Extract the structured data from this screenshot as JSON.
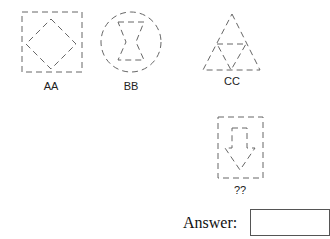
{
  "puzzle": {
    "figures": [
      {
        "id": "AA",
        "label": "AA",
        "outer": "square",
        "inner": "diamond"
      },
      {
        "id": "BB",
        "label": "BB",
        "outer": "circle",
        "inner": "hourglass"
      },
      {
        "id": "CC",
        "label": "CC",
        "outer": "triangle",
        "inner": "inverted-triangle"
      },
      {
        "id": "question",
        "label": "??",
        "outer": "square",
        "inner": "down-arrow"
      }
    ],
    "answer_label": "Answer:",
    "answer_value": ""
  },
  "colors": {
    "stroke": "#555555",
    "text": "#222222"
  }
}
